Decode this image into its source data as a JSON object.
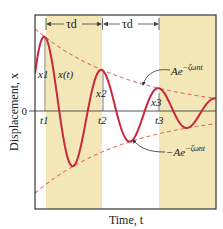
{
  "colors": {
    "band": "#f3e7b8",
    "curve": "#c8283c",
    "envelope": "#e07070",
    "frame": "#444444",
    "axis": "#555555",
    "text": "#222222"
  },
  "axes": {
    "ylabel": "Displacement, x",
    "xlabel": "Time, t",
    "zero_label": "0"
  },
  "labels": {
    "period_1": "τd",
    "period_2": "τd",
    "curve": "x(t)",
    "peaks": [
      "x1",
      "x2",
      "x3"
    ],
    "times": [
      "t1",
      "t2",
      "t3"
    ],
    "upper_envelope": "Ae^{-ζωn t}",
    "upper_envelope_base": "Ae",
    "upper_envelope_exp": "−ζωnt",
    "lower_envelope_base": "−Ae",
    "lower_envelope_exp": "−ζωnt"
  },
  "geometry": {
    "frame": {
      "x0": 35,
      "y0": 15,
      "x1": 216,
      "y1": 209
    },
    "zero_y": 111,
    "bands": [
      {
        "x0": 46,
        "x1": 102
      },
      {
        "x0": 159,
        "x1": 216
      }
    ],
    "peaks": [
      {
        "x": 45,
        "y": 37
      },
      {
        "x": 103,
        "y": 70
      },
      {
        "x": 159,
        "y": 92
      }
    ],
    "troughs": [
      {
        "x": 74,
        "y": 168
      },
      {
        "x": 131,
        "y": 141
      },
      {
        "x": 187,
        "y": 126
      }
    ]
  }
}
